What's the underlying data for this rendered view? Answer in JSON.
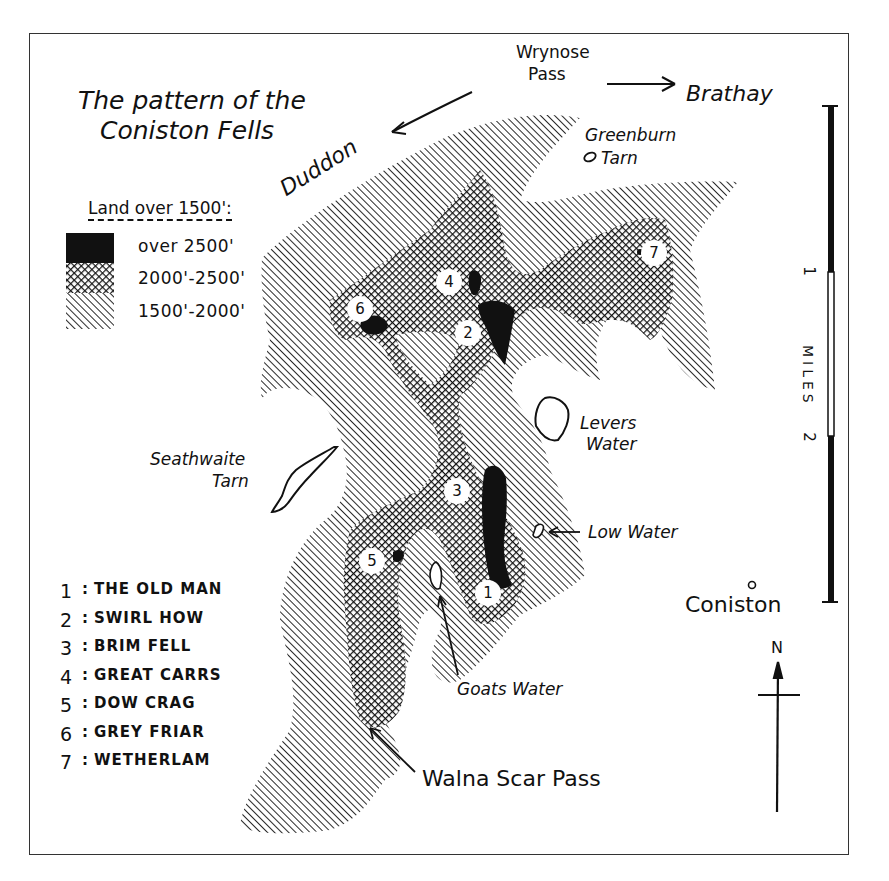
{
  "map": {
    "title_line1": "The pattern of the",
    "title_line2": "Coniston Fells",
    "legend": {
      "heading": "Land over 1500':",
      "items": [
        {
          "label": "over 2500'",
          "fill": "solid-black"
        },
        {
          "label": "2000'-2500'",
          "fill": "crosshatch"
        },
        {
          "label": "1500'-2000'",
          "fill": "diagonal-hatch"
        }
      ]
    },
    "peaks": [
      {
        "num": "1",
        "sep": ":",
        "name": "THE OLD MAN"
      },
      {
        "num": "2",
        "sep": ":",
        "name": "SWIRL HOW"
      },
      {
        "num": "3",
        "sep": ":",
        "name": "BRIM FELL"
      },
      {
        "num": "4",
        "sep": ":",
        "name": "GREAT CARRS"
      },
      {
        "num": "5",
        "sep": ":",
        "name": "DOW CRAG"
      },
      {
        "num": "6",
        "sep": ":",
        "name": "GREY FRIAR"
      },
      {
        "num": "7",
        "sep": ":",
        "name": "WETHERLAM"
      }
    ],
    "places": {
      "wrynose_1": "Wrynose",
      "wrynose_2": "Pass",
      "brathay": "Brathay",
      "duddon": "Duddon",
      "greenburn_1": "Greenburn",
      "greenburn_2": "Tarn",
      "levers_1": "Levers",
      "levers_2": "Water",
      "seathwaite_1": "Seathwaite",
      "seathwaite_2": "Tarn",
      "low_water": "Low Water",
      "goats_water": "Goats Water",
      "walna_scar": "Walna Scar Pass",
      "coniston": "Coniston"
    },
    "badges": {
      "b1": "1",
      "b2": "2",
      "b3": "3",
      "b4": "4",
      "b5": "5",
      "b6": "6",
      "b7": "7"
    },
    "scale": {
      "tick1": "1",
      "tick2": "2",
      "unit": "MILES"
    },
    "compass": {
      "north": "N"
    },
    "colors": {
      "ink": "#111111",
      "paper": "#ffffff",
      "frame": "#333333"
    }
  }
}
